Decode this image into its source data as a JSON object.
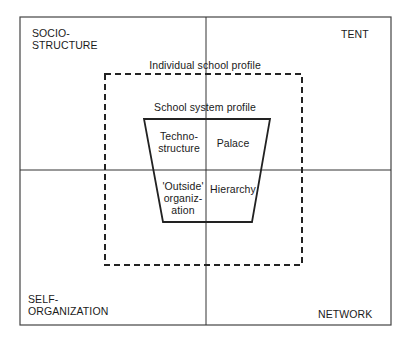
{
  "diagram": {
    "quadrants": {
      "top_left": [
        "SOCIO-",
        "STRUCTURE"
      ],
      "top_right": "TENT",
      "bottom_left": [
        "SELF-",
        "ORGANIZATION"
      ],
      "bottom_right": "NETWORK"
    },
    "individual_profile_label": "Individual school profile",
    "system_profile_label": "School system profile",
    "cells": {
      "top_left": [
        "Techno-",
        "structure"
      ],
      "top_right": "Palace",
      "bottom_left": [
        "'Outside'",
        "organiz-",
        "ation"
      ],
      "bottom_right": "Hierarchy"
    },
    "colors": {
      "line": "#2a2a2a",
      "background": "#ffffff"
    }
  }
}
